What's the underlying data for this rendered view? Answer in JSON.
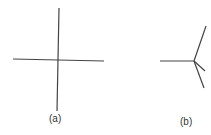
{
  "figure": {
    "panels": [
      {
        "label": "(a)",
        "description": "Two lines crossing at a four-way junction",
        "center": [
          58,
          60
        ],
        "segments": [
          {
            "from": [
              59,
              8
            ],
            "to": [
              57,
              111
            ]
          },
          {
            "from": [
              13,
              59
            ],
            "to": [
              104,
              61
            ]
          }
        ]
      },
      {
        "label": "(b)",
        "description": "Line meeting a three-branch junction",
        "center": [
          194,
          61
        ],
        "segments": [
          {
            "from": [
              160,
              61
            ],
            "to": [
              194,
              61
            ]
          },
          {
            "from": [
              194,
              61
            ],
            "to": [
              206,
              26
            ]
          },
          {
            "from": [
              194,
              61
            ],
            "to": [
              205,
              71
            ]
          },
          {
            "from": [
              194,
              61
            ],
            "to": [
              204,
              88
            ]
          }
        ]
      }
    ],
    "stroke_color": "#444444"
  }
}
